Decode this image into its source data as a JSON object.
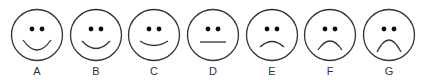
{
  "scale": {
    "title": "",
    "stroke_color": "#333333",
    "faces": [
      {
        "label": "A",
        "expression": "very-happy",
        "mouth": "big-smile"
      },
      {
        "label": "B",
        "expression": "happy",
        "mouth": "smile"
      },
      {
        "label": "C",
        "expression": "slightly-happy",
        "mouth": "slight-smile"
      },
      {
        "label": "D",
        "expression": "neutral",
        "mouth": "straight-line"
      },
      {
        "label": "E",
        "expression": "slightly-sad",
        "mouth": "slight-frown"
      },
      {
        "label": "F",
        "expression": "sad",
        "mouth": "frown"
      },
      {
        "label": "G",
        "expression": "very-sad",
        "mouth": "big-frown"
      }
    ]
  }
}
